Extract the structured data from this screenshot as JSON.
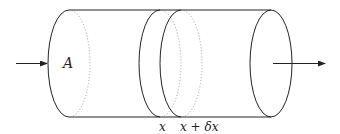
{
  "diagram": {
    "colors": {
      "stroke": "#222222",
      "hidden_edge": "#888888",
      "background": "#ffffff"
    },
    "labels": {
      "area": "A",
      "slice_start": "x",
      "slice_end": "x + δx"
    },
    "arrows": {
      "inflow": "arrow-right",
      "outflow": "arrow-right"
    }
  }
}
